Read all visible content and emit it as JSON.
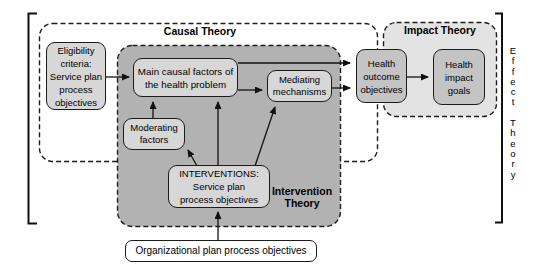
{
  "diagram": {
    "titles": {
      "causal": "Causal Theory",
      "impact": "Impact Theory",
      "intervention": "Intervention\nTheory",
      "effect_vertical": "E\nf\nf\ne\nc\nt\n\nT\nh\ne\no\nr\ny"
    },
    "boxes": {
      "eligibility": "Eligibility\ncriteria:\nService plan\nprocess\nobjectives",
      "main_causal": "Main causal factors of\nthe health problem",
      "moderating": "Moderating\nfactors",
      "mediating": "Mediating\nmechanisms",
      "interventions": "INTERVENTIONS:\nService plan\nprocess objectives",
      "health_outcome": "Health\noutcome\nobjectives",
      "health_impact": "Health\nimpact\ngoals",
      "organizational": "Organizational plan process objectives"
    },
    "colors": {
      "background": "#ffffff",
      "intervention_bg": "#b2b2b2",
      "impact_bg": "#e3e3e3",
      "causal_bg": "#ffffff",
      "box_light_bg": "#d7d7d7",
      "box_dark_bg": "#c4c4c4",
      "border": "#1c1c1c",
      "arrow": "#111111"
    }
  }
}
